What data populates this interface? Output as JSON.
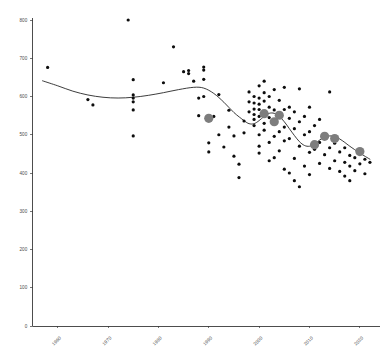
{
  "chart_data": {
    "type": "scatter",
    "title": "",
    "subtitle": "",
    "xlabel": "",
    "ylabel": "",
    "xlim": [
      1955,
      2024
    ],
    "ylim": [
      0,
      800
    ],
    "grid": false,
    "legend": "none",
    "x_ticks": [
      1960,
      1970,
      1980,
      1990,
      2000,
      2010,
      2020
    ],
    "x_tick_labels": [
      "1960",
      "1970",
      "1980",
      "1990",
      "2000",
      "2010",
      "2020"
    ],
    "y_ticks": [
      0,
      100,
      200,
      300,
      400,
      500,
      600,
      700,
      800
    ],
    "y_tick_labels": [
      "0",
      "100",
      "200",
      "300",
      "400",
      "500",
      "600",
      "700",
      "800"
    ],
    "x_tick_label_rotation": -45,
    "series": [
      {
        "name": "observations",
        "type": "scatter",
        "marker": "circle",
        "color": "#0d0d0d",
        "size": 1.6,
        "points": [
          [
            1958,
            676
          ],
          [
            1966,
            592
          ],
          [
            1967,
            578
          ],
          [
            1974,
            800
          ],
          [
            1975,
            644
          ],
          [
            1975,
            604
          ],
          [
            1975,
            596
          ],
          [
            1975,
            586
          ],
          [
            1975,
            565
          ],
          [
            1975,
            497
          ],
          [
            1981,
            636
          ],
          [
            1983,
            730
          ],
          [
            1985,
            665
          ],
          [
            1986,
            668
          ],
          [
            1986,
            660
          ],
          [
            1987,
            640
          ],
          [
            1988,
            596
          ],
          [
            1988,
            550
          ],
          [
            1989,
            677
          ],
          [
            1989,
            669
          ],
          [
            1989,
            645
          ],
          [
            1989,
            600
          ],
          [
            1990,
            545
          ],
          [
            1990,
            479
          ],
          [
            1990,
            455
          ],
          [
            1991,
            548
          ],
          [
            1992,
            605
          ],
          [
            1992,
            500
          ],
          [
            1993,
            468
          ],
          [
            1994,
            564
          ],
          [
            1994,
            520
          ],
          [
            1995,
            497
          ],
          [
            1995,
            444
          ],
          [
            1996,
            423
          ],
          [
            1996,
            388
          ],
          [
            1997,
            536
          ],
          [
            1997,
            505
          ],
          [
            1998,
            612
          ],
          [
            1998,
            586
          ],
          [
            1998,
            560
          ],
          [
            1999,
            600
          ],
          [
            1999,
            583
          ],
          [
            1999,
            567
          ],
          [
            1999,
            553
          ],
          [
            1999,
            540
          ],
          [
            1999,
            524
          ],
          [
            2000,
            628
          ],
          [
            2000,
            596
          ],
          [
            2000,
            580
          ],
          [
            2000,
            566
          ],
          [
            2000,
            548
          ],
          [
            2000,
            500
          ],
          [
            2000,
            470
          ],
          [
            2000,
            452
          ],
          [
            2001,
            640
          ],
          [
            2001,
            610
          ],
          [
            2001,
            588
          ],
          [
            2001,
            556
          ],
          [
            2001,
            530
          ],
          [
            2001,
            512
          ],
          [
            2002,
            600
          ],
          [
            2002,
            572
          ],
          [
            2002,
            545
          ],
          [
            2002,
            480
          ],
          [
            2002,
            432
          ],
          [
            2003,
            618
          ],
          [
            2003,
            565
          ],
          [
            2003,
            534
          ],
          [
            2003,
            496
          ],
          [
            2003,
            440
          ],
          [
            2004,
            590
          ],
          [
            2004,
            556
          ],
          [
            2004,
            508
          ],
          [
            2004,
            458
          ],
          [
            2005,
            624
          ],
          [
            2005,
            566
          ],
          [
            2005,
            520
          ],
          [
            2005,
            484
          ],
          [
            2005,
            410
          ],
          [
            2006,
            572
          ],
          [
            2006,
            543
          ],
          [
            2006,
            490
          ],
          [
            2006,
            400
          ],
          [
            2007,
            560
          ],
          [
            2007,
            516
          ],
          [
            2007,
            438
          ],
          [
            2007,
            380
          ],
          [
            2008,
            620
          ],
          [
            2008,
            534
          ],
          [
            2008,
            470
          ],
          [
            2008,
            364
          ],
          [
            2009,
            548
          ],
          [
            2009,
            500
          ],
          [
            2009,
            418
          ],
          [
            2010,
            572
          ],
          [
            2010,
            508
          ],
          [
            2010,
            454
          ],
          [
            2010,
            396
          ],
          [
            2011,
            524
          ],
          [
            2011,
            462
          ],
          [
            2012,
            540
          ],
          [
            2012,
            480
          ],
          [
            2012,
            425
          ],
          [
            2013,
            500
          ],
          [
            2013,
            448
          ],
          [
            2014,
            612
          ],
          [
            2014,
            466
          ],
          [
            2014,
            412
          ],
          [
            2015,
            478
          ],
          [
            2015,
            432
          ],
          [
            2016,
            455
          ],
          [
            2016,
            404
          ],
          [
            2017,
            466
          ],
          [
            2017,
            428
          ],
          [
            2017,
            392
          ],
          [
            2018,
            446
          ],
          [
            2018,
            418
          ],
          [
            2018,
            380
          ],
          [
            2019,
            440
          ],
          [
            2019,
            406
          ],
          [
            2020,
            462
          ],
          [
            2020,
            424
          ],
          [
            2021,
            436
          ],
          [
            2021,
            398
          ],
          [
            2022,
            428
          ]
        ]
      },
      {
        "name": "period-means",
        "type": "scatter",
        "marker": "circle",
        "color": "#7d7d7d",
        "size": 4.6,
        "points": [
          [
            1990,
            543
          ],
          [
            2001,
            555
          ],
          [
            2003,
            534
          ],
          [
            2004,
            551
          ],
          [
            2011,
            474
          ],
          [
            2013,
            496
          ],
          [
            2015,
            490
          ],
          [
            2020,
            456
          ]
        ]
      },
      {
        "name": "smoothed-trend",
        "type": "line",
        "color": "#1a1a1a",
        "points": [
          [
            1957,
            641
          ],
          [
            1960,
            628
          ],
          [
            1963,
            614
          ],
          [
            1966,
            604
          ],
          [
            1969,
            598
          ],
          [
            1972,
            596
          ],
          [
            1975,
            598
          ],
          [
            1978,
            603
          ],
          [
            1981,
            610
          ],
          [
            1984,
            618
          ],
          [
            1987,
            624
          ],
          [
            1989,
            622
          ],
          [
            1991,
            608
          ],
          [
            1993,
            585
          ],
          [
            1995,
            558
          ],
          [
            1997,
            537
          ],
          [
            1998,
            529
          ],
          [
            1999,
            529
          ],
          [
            2000,
            537
          ],
          [
            2001,
            548
          ],
          [
            2002,
            556
          ],
          [
            2003,
            556
          ],
          [
            2004,
            548
          ],
          [
            2005,
            534
          ],
          [
            2006,
            516
          ],
          [
            2007,
            498
          ],
          [
            2008,
            482
          ],
          [
            2009,
            472
          ],
          [
            2010,
            470
          ],
          [
            2011,
            476
          ],
          [
            2012,
            486
          ],
          [
            2013,
            494
          ],
          [
            2014,
            497
          ],
          [
            2015,
            495
          ],
          [
            2016,
            489
          ],
          [
            2017,
            480
          ],
          [
            2018,
            470
          ],
          [
            2020,
            452
          ],
          [
            2022,
            436
          ]
        ]
      }
    ]
  },
  "axes": {
    "origin_note": "",
    "x_axis_name": "x-axis",
    "y_axis_name": "y-axis"
  }
}
